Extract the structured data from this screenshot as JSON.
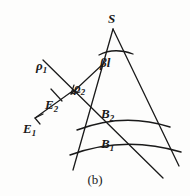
{
  "figure": {
    "caption": "(b)",
    "background_color": "#fdfdfc",
    "stroke_color": "#1a1a1a"
  },
  "labels": {
    "apex": "S",
    "angle": "βl",
    "rho1_symbol": "ρ",
    "rho1_subscript": "1",
    "rho2_symbol": "ρ",
    "rho2_subscript": "2",
    "E2_symbol": "E",
    "E2_subscript": "2",
    "E1_symbol": "E",
    "E1_subscript": "1",
    "B2_symbol": "B",
    "B2_subscript": "2",
    "B1_symbol": "B",
    "B1_subscript": "1"
  },
  "geometry": {
    "apex_point": [
      113,
      29
    ],
    "left_ray_end": [
      84,
      170
    ],
    "right_ray_end": [
      176,
      170
    ],
    "arc_beta_label_angle": "beta-l",
    "arcs": [
      {
        "name": "angle-arc",
        "from": [
          99,
          52
        ],
        "to": [
          131,
          51
        ]
      },
      {
        "name": "arc-B2",
        "from": [
          83,
          126
        ],
        "to": [
          169,
          120
        ]
      },
      {
        "name": "arc-B1",
        "from": [
          75,
          155
        ],
        "to": [
          182,
          147
        ]
      }
    ],
    "oblique_line": {
      "from": [
        161,
        176
      ],
      "to": [
        45,
        62
      ]
    },
    "rho1_arrow": {
      "from": [
        70,
        88
      ],
      "to": [
        33,
        117
      ],
      "tick_at": [
        56,
        95
      ]
    },
    "rho2_arrow": {
      "from": [
        100,
        66
      ],
      "to": [
        70,
        93
      ]
    }
  }
}
